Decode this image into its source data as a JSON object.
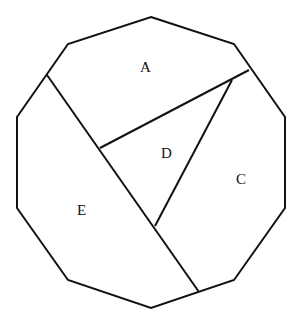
{
  "diagram": {
    "type": "polygon-partition",
    "shape": "decagon",
    "stroke_color": "#111111",
    "background": "#ffffff",
    "outline_points": [
      [
        151,
        17
      ],
      [
        234,
        44
      ],
      [
        285,
        117
      ],
      [
        285,
        208
      ],
      [
        234,
        280
      ],
      [
        151,
        308
      ],
      [
        68,
        280
      ],
      [
        17,
        208
      ],
      [
        17,
        117
      ],
      [
        68,
        44
      ]
    ],
    "segments": [
      {
        "name": "long-chord",
        "from": [
          47,
          75
        ],
        "to": [
          199,
          292
        ]
      },
      {
        "name": "chord-a-d",
        "from": [
          100,
          148
        ],
        "to": [
          249,
          70
        ]
      },
      {
        "name": "chord-d-c",
        "from": [
          232,
          80
        ],
        "to": [
          155,
          226
        ]
      }
    ],
    "regions": [
      {
        "id": "A",
        "label": "A",
        "x": 140,
        "y": 72
      },
      {
        "id": "D",
        "label": "D",
        "x": 161,
        "y": 158
      },
      {
        "id": "C",
        "label": "C",
        "x": 236,
        "y": 184
      },
      {
        "id": "E",
        "label": "E",
        "x": 77,
        "y": 215
      }
    ]
  }
}
